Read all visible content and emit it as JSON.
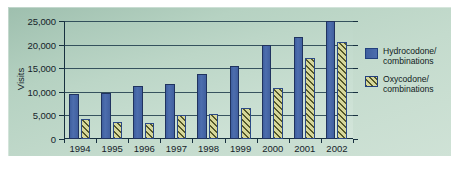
{
  "chart_data": {
    "type": "bar",
    "title": "",
    "xlabel": "",
    "ylabel": "Visits",
    "categories": [
      "1994",
      "1995",
      "1996",
      "1997",
      "1998",
      "1999",
      "2000",
      "2001",
      "2002"
    ],
    "ylim": [
      0,
      25000
    ],
    "ytick_values": [
      0,
      5000,
      10000,
      15000,
      20000,
      25000
    ],
    "ytick_labels": [
      "0",
      "5,000",
      "10,000",
      "15,000",
      "20,000",
      "25,000"
    ],
    "grid": true,
    "legend_position": "right",
    "series": [
      {
        "name": "Hydrocodone/\ncombinations",
        "color": "#4d6eae",
        "fill": "solid",
        "values": [
          9500,
          9700,
          11300,
          11700,
          13800,
          15400,
          20000,
          21600,
          25000
        ]
      },
      {
        "name": "Oxycodone/\ncombinations",
        "color": "#d6d79a",
        "fill": "diagonal-hatch",
        "values": [
          4200,
          3600,
          3300,
          5000,
          5300,
          6600,
          10900,
          17200,
          20500
        ]
      }
    ]
  },
  "legend": {
    "items": [
      {
        "label": "Hydrocodone/\ncombinations",
        "swatch": "blue-solid-swatch"
      },
      {
        "label": "Oxycodone/\ncombinations",
        "swatch": "yellow-hatch-swatch"
      }
    ]
  }
}
